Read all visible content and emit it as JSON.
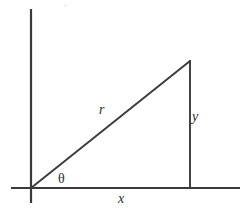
{
  "figure": {
    "background_color": "#ffffff",
    "line_color": "#3a3a3a",
    "label_color": "#2e2e2e",
    "labels": {
      "hypotenuse": "r",
      "vertical_leg": "y",
      "horizontal_leg": "x",
      "angle": "θ"
    },
    "geometry": {
      "origin": {
        "x": 31,
        "y": 188
      },
      "apex": {
        "x": 190,
        "y": 61
      },
      "foot": {
        "x": 190,
        "y": 188
      },
      "y_axis": {
        "x": 31,
        "y_top": 9,
        "y_bottom": 203
      },
      "x_axis": {
        "y": 188,
        "x_left": 11,
        "x_right": 240
      },
      "axis_stroke_width": 2.2,
      "triangle_stroke_width": 1.9
    }
  }
}
